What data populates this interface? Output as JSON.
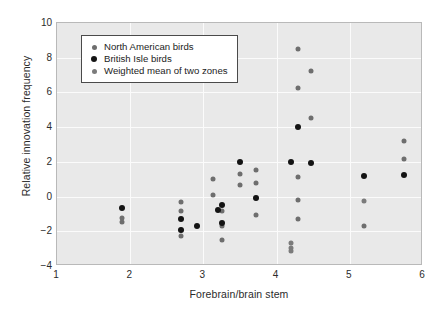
{
  "chart_data": {
    "type": "scatter",
    "title": "",
    "xlabel": "Forebrain/brain stem",
    "ylabel": "Relative innovation frequency",
    "xlim": [
      1,
      6
    ],
    "ylim": [
      -4,
      10
    ],
    "xticks": [
      1,
      2,
      3,
      4,
      5,
      6
    ],
    "yticks": [
      -4,
      -2,
      0,
      2,
      4,
      6,
      8,
      10
    ],
    "grid": true,
    "legend_position": "top-left",
    "series": [
      {
        "name": "North American birds",
        "key": "na",
        "color": "#6e6e6e",
        "points": [
          [
            1.89,
            -1.25
          ],
          [
            1.89,
            -1.45
          ],
          [
            2.69,
            -0.32
          ],
          [
            2.69,
            -0.82
          ],
          [
            2.69,
            -1.9
          ],
          [
            2.69,
            -2.3
          ],
          [
            3.13,
            1.0
          ],
          [
            3.13,
            0.08
          ],
          [
            3.25,
            -0.82
          ],
          [
            3.25,
            -1.68
          ],
          [
            3.25,
            -2.52
          ],
          [
            3.5,
            1.32
          ],
          [
            3.5,
            0.65
          ],
          [
            3.72,
            1.55
          ],
          [
            3.72,
            0.77
          ],
          [
            3.72,
            -0.07
          ],
          [
            3.72,
            -1.08
          ],
          [
            4.29,
            8.52
          ],
          [
            4.29,
            6.28
          ],
          [
            4.29,
            1.1
          ],
          [
            4.29,
            -0.2
          ],
          [
            4.29,
            -1.3
          ],
          [
            4.47,
            7.22
          ],
          [
            4.47,
            4.55
          ],
          [
            5.2,
            -1.72
          ],
          [
            5.74,
            3.22
          ],
          [
            5.74,
            2.18
          ]
        ]
      },
      {
        "name": "British Isle birds",
        "key": "bi",
        "color": "#141414",
        "points": [
          [
            1.89,
            -0.68
          ],
          [
            2.69,
            -1.28
          ],
          [
            2.69,
            -1.95
          ],
          [
            2.91,
            -1.68
          ],
          [
            3.2,
            -0.75
          ],
          [
            3.25,
            -0.48
          ],
          [
            3.25,
            -1.55
          ],
          [
            3.5,
            2.0
          ],
          [
            3.72,
            -0.07
          ],
          [
            4.19,
            2.0
          ],
          [
            4.29,
            4.0
          ],
          [
            4.47,
            1.92
          ],
          [
            5.2,
            1.18
          ],
          [
            5.74,
            1.22
          ]
        ]
      },
      {
        "name": "Weighted mean of two zones",
        "key": "wm",
        "color": "#7b7b7b",
        "points": [
          [
            4.19,
            -2.68
          ],
          [
            4.19,
            -2.95
          ],
          [
            4.19,
            -3.12
          ],
          [
            5.2,
            -0.25
          ]
        ]
      }
    ]
  },
  "legend": {
    "items": [
      {
        "label": "North American birds",
        "key": "na"
      },
      {
        "label": "British Isle birds",
        "key": "bi"
      },
      {
        "label": "Weighted mean of two zones",
        "key": "wm"
      }
    ]
  }
}
